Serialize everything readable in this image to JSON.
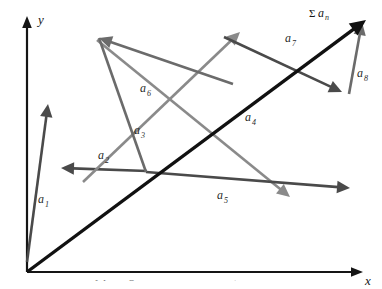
{
  "figure": {
    "background_color": "#ffffff"
  },
  "axes": {
    "color": "#151515",
    "origin": {
      "x": 27,
      "y": 272
    },
    "y_axis": {
      "label": "y",
      "from": {
        "x": 27,
        "y": 272
      },
      "to": {
        "x": 27,
        "y": 18
      }
    },
    "x_axis": {
      "label": "x",
      "from": {
        "x": 27,
        "y": 272
      },
      "to": {
        "x": 362,
        "y": 272
      }
    }
  },
  "colors": {
    "dark_gray": "#4a4a4a",
    "mid_gray": "#6b6b6b",
    "light_gray": "#8a8a8a",
    "black": "#111111",
    "text": "#2a2a2a"
  },
  "resultant": {
    "label_sigma": "Σ",
    "label_body": "a",
    "label_sub": "n",
    "label_full": "Σaₙ",
    "color": "#111111",
    "from": {
      "x": 27,
      "y": 272
    },
    "to": {
      "x": 366,
      "y": 20
    },
    "label_pos": {
      "x": 309,
      "y": 16
    }
  },
  "vectors": [
    {
      "name": "a1",
      "label_body": "a",
      "label_sub": "1",
      "color": "#4a4a4a",
      "from": {
        "x": 27,
        "y": 262
      },
      "to": {
        "x": 48,
        "y": 104
      },
      "label_pos": {
        "x": 38,
        "y": 203
      }
    },
    {
      "name": "a2",
      "label_body": "a",
      "label_sub": "2",
      "color": "#4a4a4a",
      "from": {
        "x": 147,
        "y": 171
      },
      "to": {
        "x": 61,
        "y": 168
      },
      "label_pos": {
        "x": 98,
        "y": 159
      }
    },
    {
      "name": "a3",
      "label_body": "a",
      "label_sub": "3",
      "color": "#8a8a8a",
      "from": {
        "x": 83,
        "y": 182
      },
      "to": {
        "x": 240,
        "y": 32
      },
      "label_pos": {
        "x": 134,
        "y": 134
      }
    },
    {
      "name": "a4",
      "label_body": "a",
      "label_sub": "4",
      "color": "#8a8a8a",
      "from": {
        "x": 97,
        "y": 40
      },
      "to": {
        "x": 290,
        "y": 197
      },
      "label_pos": {
        "x": 245,
        "y": 121
      }
    },
    {
      "name": "a5",
      "label_body": "a",
      "label_sub": "5",
      "color": "#4a4a4a",
      "from": {
        "x": 146,
        "y": 172
      },
      "to": {
        "x": 350,
        "y": 188
      },
      "label_pos": {
        "x": 217,
        "y": 199
      }
    },
    {
      "name": "a6",
      "label_body": "a",
      "label_sub": "6",
      "color": "#6b6b6b",
      "from": {
        "x": 233,
        "y": 84
      },
      "to": {
        "x": 99,
        "y": 38
      },
      "label_pos": {
        "x": 140,
        "y": 92
      }
    },
    {
      "name": "a7",
      "label_body": "a",
      "label_sub": "7",
      "color": "#4a4a4a",
      "from": {
        "x": 224,
        "y": 37
      },
      "to": {
        "x": 342,
        "y": 92
      },
      "label_pos": {
        "x": 285,
        "y": 42
      }
    },
    {
      "name": "a8",
      "label_body": "a",
      "label_sub": "8",
      "color": "#6b6b6b",
      "from": {
        "x": 349,
        "y": 94
      },
      "to": {
        "x": 362,
        "y": 22
      },
      "label_pos": {
        "x": 357,
        "y": 77
      }
    },
    {
      "name": "a6-tail-extension",
      "label_body": "",
      "label_sub": "",
      "color": "#6b6b6b",
      "from": {
        "x": 146,
        "y": 172
      },
      "to": {
        "x": 99,
        "y": 38
      },
      "label_pos": {
        "x": 0,
        "y": 0
      }
    }
  ],
  "caption": {
    "text": "A vector added by placing each vector head to tail; the resultant sum"
  }
}
